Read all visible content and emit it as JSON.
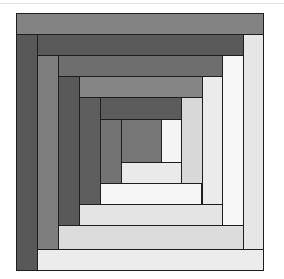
{
  "figure": {
    "origin": [
      16,
      13
    ],
    "border_color": "#1e1e1e",
    "pieces": [
      {
        "name": "top-strip-1",
        "x": 0,
        "y": 0,
        "w": 248,
        "h": 22,
        "color": "#838383"
      },
      {
        "name": "left-strip-1",
        "x": 0,
        "y": 21,
        "w": 22,
        "h": 237,
        "color": "#585858"
      },
      {
        "name": "right-strip-1",
        "x": 227,
        "y": 21,
        "w": 21,
        "h": 216,
        "color": "#e6e6e6"
      },
      {
        "name": "bottom-strip-1",
        "x": 21,
        "y": 236,
        "w": 227,
        "h": 22,
        "color": "#ececec"
      },
      {
        "name": "top-strip-2",
        "x": 21,
        "y": 21,
        "w": 207,
        "h": 22,
        "color": "#5a5a5a"
      },
      {
        "name": "left-strip-2",
        "x": 21,
        "y": 42,
        "w": 22,
        "h": 195,
        "color": "#7e7e7e"
      },
      {
        "name": "right-strip-2",
        "x": 206,
        "y": 42,
        "w": 22,
        "h": 171,
        "color": "#f7f7f7"
      },
      {
        "name": "bottom-strip-2",
        "x": 42,
        "y": 212,
        "w": 186,
        "h": 25,
        "color": "#dcdcdc"
      },
      {
        "name": "top-strip-3",
        "x": 42,
        "y": 42,
        "w": 165,
        "h": 22,
        "color": "#6e6e6e"
      },
      {
        "name": "left-strip-3",
        "x": 42,
        "y": 63,
        "w": 22,
        "h": 150,
        "color": "#595959"
      },
      {
        "name": "right-strip-3",
        "x": 186,
        "y": 63,
        "w": 21,
        "h": 129,
        "color": "#ebebeb"
      },
      {
        "name": "bottom-strip-3",
        "x": 63,
        "y": 191,
        "w": 144,
        "h": 22,
        "color": "#e4e4e4"
      },
      {
        "name": "top-strip-4",
        "x": 63,
        "y": 63,
        "w": 124,
        "h": 22,
        "color": "#858585"
      },
      {
        "name": "left-strip-4",
        "x": 63,
        "y": 84,
        "w": 22,
        "h": 108,
        "color": "#5e5e5e"
      },
      {
        "name": "right-strip-4",
        "x": 165,
        "y": 84,
        "w": 22,
        "h": 87,
        "color": "#d8d8d8"
      },
      {
        "name": "bottom-strip-4",
        "x": 84,
        "y": 170,
        "w": 102,
        "h": 22,
        "color": "#f6f6f6"
      },
      {
        "name": "top-strip-5",
        "x": 84,
        "y": 84,
        "w": 82,
        "h": 23,
        "color": "#5c5c5c"
      },
      {
        "name": "left-strip-5",
        "x": 84,
        "y": 106,
        "w": 22,
        "h": 65,
        "color": "#737373"
      },
      {
        "name": "right-strip-5",
        "x": 145,
        "y": 106,
        "w": 21,
        "h": 44,
        "color": "#f4f4f4"
      },
      {
        "name": "bottom-strip-5",
        "x": 105,
        "y": 149,
        "w": 61,
        "h": 22,
        "color": "#eaeaea"
      },
      {
        "name": "center-square",
        "x": 105,
        "y": 106,
        "w": 41,
        "h": 44,
        "color": "#777777"
      }
    ]
  }
}
